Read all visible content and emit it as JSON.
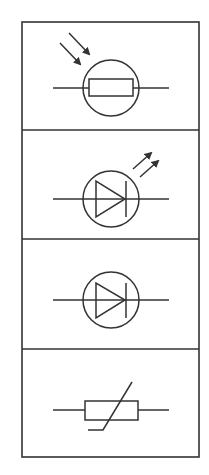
{
  "diagram": {
    "title": "Electronic component symbols",
    "stroke_color": "#333333",
    "background_color": "#ffffff",
    "frame": {
      "x": 22,
      "y": 22,
      "width": 177,
      "height": 435,
      "dividers_y": [
        130,
        239,
        349
      ]
    },
    "symbols": [
      {
        "name": "Light dependent resistor (LDR)",
        "shape": "resistor-in-circle-with-incoming-arrows",
        "panel_top": 22,
        "panel_bottom": 130
      },
      {
        "name": "Light emitting diode (LED)",
        "shape": "diode-in-circle-with-outgoing-arrows",
        "panel_top": 130,
        "panel_bottom": 239
      },
      {
        "name": "Diode",
        "shape": "diode-in-circle",
        "panel_top": 239,
        "panel_bottom": 349
      },
      {
        "name": "Thermistor",
        "shape": "resistor-with-diagonal-line",
        "panel_top": 349,
        "panel_bottom": 457
      }
    ]
  }
}
